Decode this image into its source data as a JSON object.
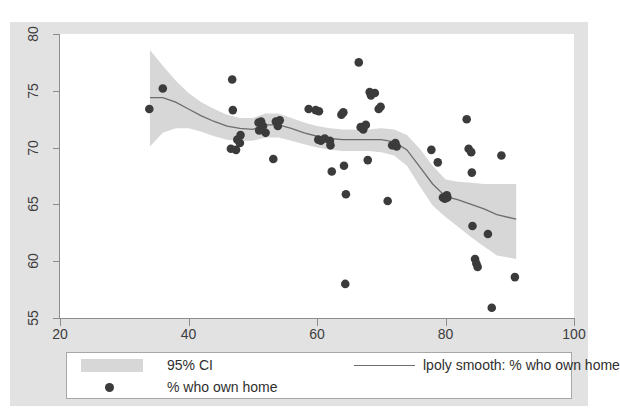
{
  "figure": {
    "background_color": "#e2e2e2",
    "panel_color": "#ffffff",
    "clipped_top_text": "",
    "band_color": "#d7d7d7",
    "line_color": "#6d6d6d",
    "marker_color": "#3b3b3b",
    "axis_color": "#8c8c8c"
  },
  "legend": {
    "ci_label": "95% CI",
    "scatter_label": "% who own home",
    "smooth_label": "lpoly smooth: % who own home"
  },
  "chart_data": {
    "type": "scatter",
    "title": "",
    "xlabel": "",
    "ylabel": "",
    "xlim": [
      20,
      100
    ],
    "ylim": [
      55,
      80
    ],
    "xticks": [
      20,
      40,
      60,
      80,
      100
    ],
    "yticks": [
      55,
      60,
      65,
      70,
      75,
      80
    ],
    "grid": false,
    "legend_position": "below-plot",
    "series": [
      {
        "name": "% who own home",
        "type": "scatter",
        "marker": "filled-circle",
        "color": "#3b3b3b",
        "points": [
          [
            33.9,
            73.4
          ],
          [
            36.0,
            75.2
          ],
          [
            46.8,
            76.0
          ],
          [
            46.9,
            73.3
          ],
          [
            46.6,
            69.9
          ],
          [
            47.4,
            69.8
          ],
          [
            47.6,
            70.7
          ],
          [
            48.0,
            70.4
          ],
          [
            48.1,
            71.1
          ],
          [
            50.9,
            72.2
          ],
          [
            51.0,
            71.5
          ],
          [
            51.3,
            72.3
          ],
          [
            51.6,
            71.9
          ],
          [
            52.0,
            71.3
          ],
          [
            53.2,
            69.0
          ],
          [
            53.6,
            72.3
          ],
          [
            53.9,
            71.9
          ],
          [
            54.2,
            72.4
          ],
          [
            58.7,
            73.4
          ],
          [
            59.8,
            73.3
          ],
          [
            60.3,
            73.2
          ],
          [
            60.2,
            70.7
          ],
          [
            60.6,
            70.6
          ],
          [
            61.2,
            70.8
          ],
          [
            62.0,
            70.6
          ],
          [
            62.1,
            70.2
          ],
          [
            62.3,
            67.9
          ],
          [
            63.8,
            72.9
          ],
          [
            64.1,
            73.1
          ],
          [
            64.2,
            68.4
          ],
          [
            64.4,
            58.0
          ],
          [
            64.5,
            65.9
          ],
          [
            66.5,
            77.5
          ],
          [
            66.8,
            71.8
          ],
          [
            67.2,
            71.6
          ],
          [
            67.6,
            72.0
          ],
          [
            67.9,
            68.9
          ],
          [
            68.2,
            74.9
          ],
          [
            68.4,
            74.6
          ],
          [
            69.0,
            74.8
          ],
          [
            69.6,
            73.4
          ],
          [
            69.9,
            73.6
          ],
          [
            71.0,
            65.3
          ],
          [
            71.7,
            70.2
          ],
          [
            72.2,
            70.4
          ],
          [
            72.4,
            70.1
          ],
          [
            77.8,
            69.8
          ],
          [
            78.8,
            68.7
          ],
          [
            79.6,
            65.6
          ],
          [
            79.9,
            65.5
          ],
          [
            80.2,
            65.8
          ],
          [
            80.3,
            65.6
          ],
          [
            83.3,
            72.5
          ],
          [
            83.6,
            69.9
          ],
          [
            84.0,
            69.6
          ],
          [
            84.1,
            67.8
          ],
          [
            84.2,
            63.1
          ],
          [
            84.6,
            60.2
          ],
          [
            84.8,
            59.8
          ],
          [
            85.0,
            59.5
          ],
          [
            86.6,
            62.4
          ],
          [
            87.2,
            55.9
          ],
          [
            88.7,
            69.3
          ],
          [
            90.8,
            58.6
          ]
        ]
      },
      {
        "name": "lpoly smooth: % who own home",
        "type": "line",
        "color": "#6d6d6d",
        "points": [
          [
            34.0,
            74.4
          ],
          [
            36.0,
            74.4
          ],
          [
            38.0,
            74.0
          ],
          [
            40.0,
            73.4
          ],
          [
            42.0,
            72.8
          ],
          [
            44.0,
            72.3
          ],
          [
            46.0,
            71.9
          ],
          [
            48.0,
            71.7
          ],
          [
            50.0,
            71.6
          ],
          [
            52.0,
            72.0
          ],
          [
            54.0,
            72.0
          ],
          [
            56.0,
            71.7
          ],
          [
            58.0,
            71.3
          ],
          [
            60.0,
            71.0
          ],
          [
            62.0,
            70.8
          ],
          [
            64.0,
            70.7
          ],
          [
            66.0,
            70.7
          ],
          [
            68.0,
            70.7
          ],
          [
            70.0,
            70.7
          ],
          [
            72.0,
            70.5
          ],
          [
            74.0,
            69.8
          ],
          [
            76.0,
            68.3
          ],
          [
            78.0,
            66.8
          ],
          [
            80.0,
            65.7
          ],
          [
            82.0,
            65.4
          ],
          [
            84.0,
            65.0
          ],
          [
            86.0,
            64.6
          ],
          [
            88.0,
            64.1
          ],
          [
            91.0,
            63.7
          ]
        ]
      },
      {
        "name": "95% CI",
        "type": "band",
        "color": "#d7d7d7",
        "upper": [
          [
            34.0,
            78.6
          ],
          [
            36.0,
            77.2
          ],
          [
            38.0,
            75.9
          ],
          [
            40.0,
            74.8
          ],
          [
            42.0,
            74.0
          ],
          [
            44.0,
            73.4
          ],
          [
            46.0,
            72.9
          ],
          [
            48.0,
            72.6
          ],
          [
            50.0,
            72.6
          ],
          [
            52.0,
            73.0
          ],
          [
            54.0,
            73.0
          ],
          [
            56.0,
            72.6
          ],
          [
            58.0,
            72.2
          ],
          [
            60.0,
            71.9
          ],
          [
            62.0,
            71.7
          ],
          [
            64.0,
            71.6
          ],
          [
            66.0,
            71.6
          ],
          [
            68.0,
            71.6
          ],
          [
            70.0,
            71.7
          ],
          [
            72.0,
            71.6
          ],
          [
            74.0,
            71.1
          ],
          [
            76.0,
            69.9
          ],
          [
            78.0,
            68.4
          ],
          [
            80.0,
            67.2
          ],
          [
            82.0,
            67.0
          ],
          [
            84.0,
            66.9
          ],
          [
            86.0,
            66.8
          ],
          [
            88.0,
            66.8
          ],
          [
            91.0,
            66.8
          ]
        ],
        "lower": [
          [
            34.0,
            70.1
          ],
          [
            36.0,
            71.3
          ],
          [
            38.0,
            71.7
          ],
          [
            40.0,
            71.7
          ],
          [
            42.0,
            71.4
          ],
          [
            44.0,
            71.0
          ],
          [
            46.0,
            70.7
          ],
          [
            48.0,
            70.6
          ],
          [
            50.0,
            70.6
          ],
          [
            52.0,
            70.9
          ],
          [
            54.0,
            70.9
          ],
          [
            56.0,
            70.6
          ],
          [
            58.0,
            70.3
          ],
          [
            60.0,
            70.0
          ],
          [
            62.0,
            69.8
          ],
          [
            64.0,
            69.7
          ],
          [
            66.0,
            69.7
          ],
          [
            68.0,
            69.7
          ],
          [
            70.0,
            69.6
          ],
          [
            72.0,
            69.3
          ],
          [
            74.0,
            68.4
          ],
          [
            76.0,
            66.6
          ],
          [
            78.0,
            64.9
          ],
          [
            80.0,
            63.9
          ],
          [
            82.0,
            63.0
          ],
          [
            84.0,
            62.1
          ],
          [
            86.0,
            61.3
          ],
          [
            88.0,
            60.5
          ],
          [
            91.0,
            60.2
          ]
        ]
      }
    ]
  }
}
